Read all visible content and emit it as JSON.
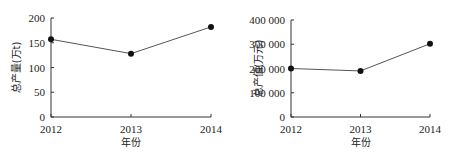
{
  "chart_data": [
    {
      "type": "line",
      "title": "",
      "xlabel": "年份",
      "ylabel": "总产量(万t)",
      "x": [
        "2012",
        "2013",
        "2014"
      ],
      "series": [
        {
          "name": "总产量",
          "values": [
            157,
            128,
            182
          ]
        }
      ],
      "yticks": [
        0,
        50,
        100,
        150,
        200
      ],
      "ytick_labels": [
        "0",
        "50",
        "100",
        "150",
        "200"
      ],
      "ylim": [
        0,
        200
      ],
      "grid": false,
      "legend": "none"
    },
    {
      "type": "line",
      "title": "",
      "xlabel": "年份",
      "ylabel": "总产值(万元)",
      "x": [
        "2012",
        "2013",
        "2014"
      ],
      "series": [
        {
          "name": "总产值",
          "values": [
            200000,
            190000,
            302000
          ]
        }
      ],
      "yticks": [
        0,
        100000,
        200000,
        300000,
        400000
      ],
      "ytick_labels": [
        "0",
        "100 000",
        "200 000",
        "300 000",
        "400 000"
      ],
      "ylim": [
        0,
        400000
      ],
      "grid": false,
      "legend": "none"
    }
  ]
}
